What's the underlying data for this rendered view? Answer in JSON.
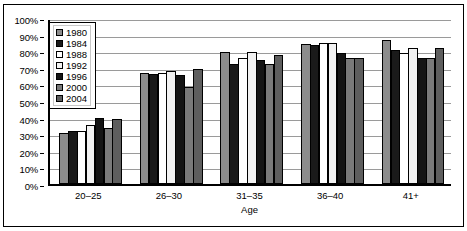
{
  "chart_data": {
    "type": "bar",
    "title": "",
    "xlabel": "Age",
    "ylabel": "",
    "categories": [
      "20–25",
      "26–30",
      "31–35",
      "36–40",
      "41+"
    ],
    "ylim": [
      0,
      100
    ],
    "ytick_labels": [
      "100%",
      "90%",
      "80%",
      "70%",
      "60%",
      "50%",
      "40%",
      "30%",
      "20%",
      "10%",
      "0%"
    ],
    "ytick_values": [
      100,
      90,
      80,
      70,
      60,
      50,
      40,
      30,
      20,
      10,
      0
    ],
    "grid": true,
    "legend_position": "inside-top-left",
    "series": [
      {
        "name": "1980",
        "color": "#8c8c8c",
        "values": [
          31,
          67,
          79.5,
          84.5,
          87
        ]
      },
      {
        "name": "1984",
        "color": "#1a1a1a",
        "values": [
          32,
          66,
          72.5,
          84,
          81
        ]
      },
      {
        "name": "1988",
        "color": "#ffffff",
        "values": [
          32,
          67,
          76,
          85,
          79
        ]
      },
      {
        "name": "1992",
        "color": "#f2f2f2",
        "values": [
          35.5,
          68,
          79.5,
          85,
          82
        ]
      },
      {
        "name": "1996",
        "color": "#141414",
        "values": [
          39.5,
          65.5,
          75,
          79,
          76
        ]
      },
      {
        "name": "2000",
        "color": "#7a7a7a",
        "values": [
          34,
          58.5,
          72.5,
          76,
          76
        ]
      },
      {
        "name": "2004",
        "color": "#5e5e5e",
        "values": [
          39,
          69,
          78,
          76,
          82
        ]
      }
    ]
  },
  "axis": {
    "x_title": "Age"
  }
}
